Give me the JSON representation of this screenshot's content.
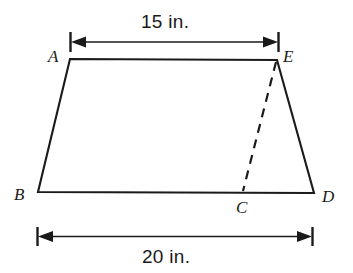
{
  "figure": {
    "kind": "geometry-diagram",
    "shape": "trapezoid",
    "stroke_color": "#1a1a1a",
    "background_color": "#ffffff",
    "vertex_labels": [
      {
        "name": "A",
        "text": "A",
        "x": 70,
        "y": 59,
        "label_x": 48,
        "label_y": 48
      },
      {
        "name": "E",
        "text": "E",
        "x": 277,
        "y": 60,
        "label_x": 283,
        "label_y": 48
      },
      {
        "name": "B",
        "text": "B",
        "x": 38,
        "y": 192,
        "label_x": 14,
        "label_y": 186
      },
      {
        "name": "C",
        "text": "C",
        "x": 243,
        "y": 192,
        "label_x": 236,
        "label_y": 199
      },
      {
        "name": "D",
        "text": "D",
        "x": 314,
        "y": 193,
        "label_x": 322,
        "label_y": 188
      }
    ],
    "dimensions": [
      {
        "name": "top-width",
        "label": "15 in.",
        "value": 15,
        "unit": "in.",
        "from_x": 70,
        "to_x": 278,
        "line_y": 42,
        "text_x": 173,
        "text_y": 14
      },
      {
        "name": "bottom-width",
        "label": "20 in.",
        "value": 20,
        "unit": "in.",
        "from_x": 37,
        "to_x": 312,
        "line_y": 236,
        "text_x": 175,
        "text_y": 246
      }
    ],
    "segments": [
      {
        "name": "side-AB",
        "style": "solid"
      },
      {
        "name": "top-AE",
        "style": "solid"
      },
      {
        "name": "side-ED",
        "style": "solid"
      },
      {
        "name": "base-BD",
        "style": "solid"
      },
      {
        "name": "diagonal-EC",
        "style": "dashed"
      }
    ]
  }
}
